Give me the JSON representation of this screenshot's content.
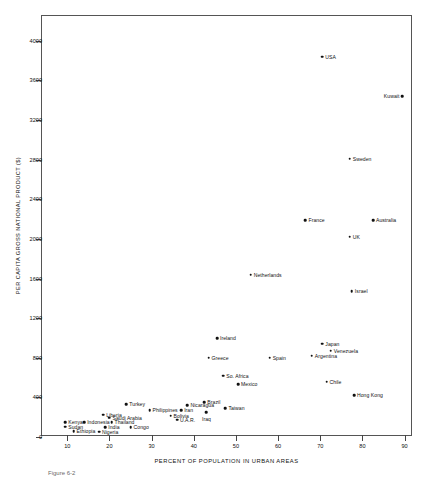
{
  "chart_data": {
    "type": "scatter",
    "title": "",
    "xlabel": "PERCENT OF POPULATION IN URBAN AREAS",
    "ylabel": "PER CAPITA GROSS NATIONAL PRODUCT ($)",
    "xlim": [
      4,
      92
    ],
    "ylim": [
      0,
      4250
    ],
    "xticks": [
      10,
      20,
      30,
      40,
      50,
      60,
      70,
      80,
      90
    ],
    "yticks": [
      0,
      400,
      800,
      1200,
      1600,
      2000,
      2400,
      2800,
      3200,
      3600,
      4000
    ],
    "grid": false,
    "legend": "none",
    "marker": "filled-circle",
    "points": [
      {
        "label": "USA",
        "x": 70.5,
        "y": 3840,
        "pos": "right"
      },
      {
        "label": "Kuwait",
        "x": 89.5,
        "y": 3440,
        "pos": "left"
      },
      {
        "label": "Sweden",
        "x": 77.0,
        "y": 2810,
        "pos": "right"
      },
      {
        "label": "Australia",
        "x": 82.5,
        "y": 2190,
        "pos": "right"
      },
      {
        "label": "France",
        "x": 66.5,
        "y": 2190,
        "pos": "right"
      },
      {
        "label": "UK",
        "x": 77.0,
        "y": 2020,
        "pos": "right"
      },
      {
        "label": "Netherlands",
        "x": 53.5,
        "y": 1640,
        "pos": "right"
      },
      {
        "label": "Israel",
        "x": 77.5,
        "y": 1470,
        "pos": "right"
      },
      {
        "label": "Ireland",
        "x": 45.5,
        "y": 1000,
        "pos": "right"
      },
      {
        "label": "Japan",
        "x": 70.5,
        "y": 940,
        "pos": "right"
      },
      {
        "label": "Venezuela",
        "x": 72.5,
        "y": 870,
        "pos": "right"
      },
      {
        "label": "Argentina",
        "x": 68.0,
        "y": 820,
        "pos": "right"
      },
      {
        "label": "Greece",
        "x": 43.5,
        "y": 800,
        "pos": "right"
      },
      {
        "label": "Spain",
        "x": 58.0,
        "y": 800,
        "pos": "right"
      },
      {
        "label": "So. Africa",
        "x": 47.0,
        "y": 620,
        "pos": "right"
      },
      {
        "label": "Chile",
        "x": 71.5,
        "y": 560,
        "pos": "right"
      },
      {
        "label": "Mexico",
        "x": 50.5,
        "y": 530,
        "pos": "right"
      },
      {
        "label": "Hong Kong",
        "x": 78.0,
        "y": 420,
        "pos": "right"
      },
      {
        "label": "Brazil",
        "x": 42.5,
        "y": 350,
        "pos": "right"
      },
      {
        "label": "Turkey",
        "x": 24.0,
        "y": 330,
        "pos": "right"
      },
      {
        "label": "Nicaragua",
        "x": 38.5,
        "y": 320,
        "pos": "right"
      },
      {
        "label": "Taiwan",
        "x": 47.5,
        "y": 290,
        "pos": "right"
      },
      {
        "label": "Philippines",
        "x": 29.5,
        "y": 270,
        "pos": "right"
      },
      {
        "label": "Iran",
        "x": 37.0,
        "y": 270,
        "pos": "right"
      },
      {
        "label": "Iraq",
        "x": 43.0,
        "y": 250,
        "pos": "below"
      },
      {
        "label": "Liberia",
        "x": 18.5,
        "y": 225,
        "pos": "right"
      },
      {
        "label": "Bolivia",
        "x": 34.5,
        "y": 215,
        "pos": "right"
      },
      {
        "label": "Saudi Arabia",
        "x": 20.0,
        "y": 195,
        "pos": "right"
      },
      {
        "label": "U.A.R.",
        "x": 36.0,
        "y": 175,
        "pos": "right"
      },
      {
        "label": "Kenya",
        "x": 9.5,
        "y": 150,
        "pos": "right"
      },
      {
        "label": "Indonesia",
        "x": 14.0,
        "y": 150,
        "pos": "right"
      },
      {
        "label": "Thailand",
        "x": 20.5,
        "y": 150,
        "pos": "right"
      },
      {
        "label": "Sudan",
        "x": 9.5,
        "y": 105,
        "pos": "right"
      },
      {
        "label": "India",
        "x": 19.0,
        "y": 100,
        "pos": "right"
      },
      {
        "label": "Congo",
        "x": 25.0,
        "y": 100,
        "pos": "right"
      },
      {
        "label": "Ethiopia",
        "x": 11.5,
        "y": 60,
        "pos": "right"
      },
      {
        "label": "Nigeria",
        "x": 17.5,
        "y": 55,
        "pos": "right"
      }
    ]
  },
  "caption": {
    "text": "Figure 6-2"
  }
}
